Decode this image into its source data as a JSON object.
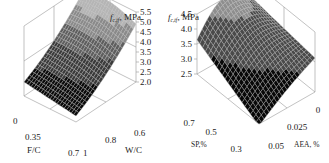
{
  "chart_data": [
    {
      "type": "surface",
      "title": "",
      "zlabel": "f_c,tf, MPa",
      "zlabel_main": "f",
      "zlabel_sub": "c,tf",
      "zlabel_unit": ", MPa",
      "xlabel": "F/C",
      "ylabel": "W/C",
      "x_ticks": [
        "0",
        "0.35",
        "0.7"
      ],
      "y_ticks": [
        "0.6",
        "0.8",
        "1"
      ],
      "z_ticks": [
        "2.0",
        "2.5",
        "3.0",
        "3.5",
        "4.0",
        "4.5",
        "5.0",
        "5.5"
      ],
      "xlim": [
        0,
        0.7
      ],
      "ylim": [
        0.6,
        1.0
      ],
      "zlim": [
        2.0,
        5.5
      ],
      "surface_corners": {
        "F/C=0,W/C=0.6": 5.2,
        "F/C=0.7,W/C=0.6": 4.9,
        "F/C=0,W/C=1": 2.9,
        "F/C=0.7,W/C=1": 2.3
      }
    },
    {
      "type": "surface",
      "title": "",
      "zlabel": "f_c,tf, MPa",
      "zlabel_main": "f",
      "zlabel_sub": "c,tf",
      "zlabel_unit": ", MPa",
      "xlabel": "SP,%",
      "ylabel": "AEA, %",
      "x_ticks": [
        "0.7",
        "0.5",
        "0.3"
      ],
      "y_ticks": [
        "0",
        "0.025",
        "0.05"
      ],
      "z_ticks": [
        "2.5",
        "3.0",
        "3.5",
        "4.0",
        "4.5"
      ],
      "xlim": [
        0.3,
        0.7
      ],
      "ylim": [
        0,
        0.05
      ],
      "zlim": [
        2.5,
        4.5
      ],
      "surface_corners": {
        "SP=0.7,AEA=0": 4.6,
        "SP=0.3,AEA=0": 3.5,
        "SP=0.7,AEA=0.05": 3.5,
        "SP=0.3,AEA=0.05": 2.6
      }
    }
  ]
}
